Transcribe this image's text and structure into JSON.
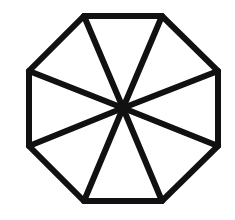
{
  "diagram": {
    "shape": "octagon",
    "stroke_color": "#111111",
    "fill_color": "#ffffff",
    "stroke_width": 6,
    "center": [
      123,
      108
    ],
    "vertices": [
      [
        84,
        16
      ],
      [
        162,
        16
      ],
      [
        218,
        71
      ],
      [
        218,
        146
      ],
      [
        162,
        201
      ],
      [
        84,
        201
      ],
      [
        29,
        146
      ],
      [
        29,
        71
      ]
    ],
    "triangle_count": 8
  }
}
